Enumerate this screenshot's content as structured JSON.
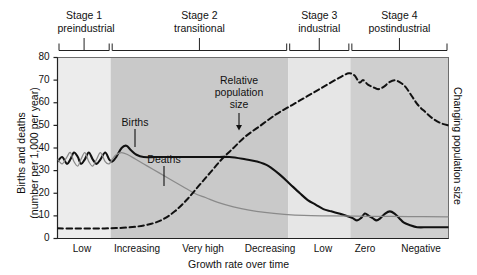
{
  "chart_data": {
    "type": "line",
    "ylabel_left_line1": "Births and deaths",
    "ylabel_left_line2": "(number per 1,000 per year)",
    "ylabel_right": "Changing population size",
    "xlabel": "Growth rate over time",
    "ylim": [
      0,
      80
    ],
    "yticks": [
      0,
      10,
      20,
      30,
      40,
      50,
      60,
      70,
      80
    ],
    "grid": false,
    "legend_position": "inline-annotations",
    "x_categories": [
      "Low",
      "Increasing",
      "Very high",
      "Decreasing",
      "Low",
      "Zero",
      "Negative"
    ],
    "stages": [
      {
        "label_line1": "Stage 1",
        "label_line2": "preindustrial",
        "start_pct": 0.0,
        "end_pct": 13.6,
        "shade": "#ececec"
      },
      {
        "label_line1": "Stage 2",
        "label_line2": "transitional",
        "start_pct": 13.6,
        "end_pct": 59.0,
        "shade": "#c9c9c9"
      },
      {
        "label_line1": "Stage 3",
        "label_line2": "industrial",
        "start_pct": 59.0,
        "end_pct": 74.9,
        "shade": "#e6e6e6"
      },
      {
        "label_line1": "Stage 4",
        "label_line2": "postindustrial",
        "start_pct": 74.9,
        "end_pct": 100.0,
        "shade": "#cfcfcf"
      }
    ],
    "annotations": [
      {
        "name": "births-label",
        "text": "Births"
      },
      {
        "name": "deaths-label",
        "text": "Deaths"
      },
      {
        "name": "relative-population-size-label",
        "text_line1": "Relative",
        "text_line2": "population",
        "text_line3": "size"
      }
    ],
    "series": [
      {
        "name": "Births",
        "style": "solid-thick-black",
        "color": "#111111",
        "points": [
          [
            0.0,
            34
          ],
          [
            1.2,
            36
          ],
          [
            2.4,
            33
          ],
          [
            3.3,
            35
          ],
          [
            4.2,
            38
          ],
          [
            5.2,
            36
          ],
          [
            6.0,
            33
          ],
          [
            7.0,
            35
          ],
          [
            8.0,
            38
          ],
          [
            9.0,
            35
          ],
          [
            10.0,
            33
          ],
          [
            11.0,
            35
          ],
          [
            12.2,
            38
          ],
          [
            13.2,
            35
          ],
          [
            14.0,
            34
          ],
          [
            15.0,
            36
          ],
          [
            16.4,
            40
          ],
          [
            17.6,
            41
          ],
          [
            18.8,
            39
          ],
          [
            20.2,
            37
          ],
          [
            22.0,
            36
          ],
          [
            25.0,
            36
          ],
          [
            28.0,
            36
          ],
          [
            32.0,
            36
          ],
          [
            36.0,
            36
          ],
          [
            40.0,
            36
          ],
          [
            44.0,
            36
          ],
          [
            48.0,
            35
          ],
          [
            51.0,
            34
          ],
          [
            54.0,
            32
          ],
          [
            57.0,
            28
          ],
          [
            59.5,
            24
          ],
          [
            62.0,
            20
          ],
          [
            64.0,
            17
          ],
          [
            66.0,
            15
          ],
          [
            68.0,
            13
          ],
          [
            70.0,
            12
          ],
          [
            72.0,
            11
          ],
          [
            74.0,
            10
          ],
          [
            75.5,
            9
          ],
          [
            76.6,
            8
          ],
          [
            77.6,
            9
          ],
          [
            78.6,
            11
          ],
          [
            79.6,
            10
          ],
          [
            80.6,
            9
          ],
          [
            81.6,
            8
          ],
          [
            82.6,
            9
          ],
          [
            83.8,
            11
          ],
          [
            85.0,
            12
          ],
          [
            86.2,
            11
          ],
          [
            87.4,
            9
          ],
          [
            88.6,
            7
          ],
          [
            90.0,
            6
          ],
          [
            92.0,
            5
          ],
          [
            95.0,
            5
          ],
          [
            100.0,
            5
          ]
        ]
      },
      {
        "name": "Deaths",
        "style": "solid-thin-gray",
        "color": "#8a8a8a",
        "points": [
          [
            0.0,
            35
          ],
          [
            1.2,
            33
          ],
          [
            2.4,
            36
          ],
          [
            3.3,
            38
          ],
          [
            4.2,
            34
          ],
          [
            5.2,
            32
          ],
          [
            6.0,
            35
          ],
          [
            7.0,
            38
          ],
          [
            8.0,
            34
          ],
          [
            9.0,
            32
          ],
          [
            10.0,
            35
          ],
          [
            11.0,
            38
          ],
          [
            12.2,
            34
          ],
          [
            13.2,
            33
          ],
          [
            14.0,
            35
          ],
          [
            15.0,
            37
          ],
          [
            16.4,
            38
          ],
          [
            18.0,
            37
          ],
          [
            20.0,
            35
          ],
          [
            23.0,
            32
          ],
          [
            26.0,
            29
          ],
          [
            29.0,
            26
          ],
          [
            32.0,
            23
          ],
          [
            35.0,
            20
          ],
          [
            38.0,
            18
          ],
          [
            41.0,
            16
          ],
          [
            45.0,
            14
          ],
          [
            49.0,
            12.5
          ],
          [
            53.0,
            11.5
          ],
          [
            58.0,
            10.7
          ],
          [
            63.0,
            10.2
          ],
          [
            70.0,
            10.0
          ],
          [
            80.0,
            9.8
          ],
          [
            90.0,
            9.7
          ],
          [
            100.0,
            9.6
          ]
        ]
      },
      {
        "name": "Relative population size",
        "style": "dashed-black",
        "color": "#111111",
        "points": [
          [
            0.0,
            4.5
          ],
          [
            5.0,
            4.4
          ],
          [
            10.0,
            4.4
          ],
          [
            15.0,
            4.6
          ],
          [
            20.0,
            5.2
          ],
          [
            24.0,
            6.5
          ],
          [
            27.0,
            8.5
          ],
          [
            30.0,
            12
          ],
          [
            33.0,
            17
          ],
          [
            36.0,
            23
          ],
          [
            39.0,
            29
          ],
          [
            42.0,
            35
          ],
          [
            45.0,
            40
          ],
          [
            48.0,
            45
          ],
          [
            52.0,
            50
          ],
          [
            56.0,
            55
          ],
          [
            60.0,
            59
          ],
          [
            64.0,
            63
          ],
          [
            68.0,
            67
          ],
          [
            72.0,
            71
          ],
          [
            74.5,
            73
          ],
          [
            76.0,
            72
          ],
          [
            77.2,
            69
          ],
          [
            78.2,
            70
          ],
          [
            79.4,
            68
          ],
          [
            80.6,
            67
          ],
          [
            82.0,
            66
          ],
          [
            83.4,
            67
          ],
          [
            84.8,
            69
          ],
          [
            86.2,
            70
          ],
          [
            87.6,
            69
          ],
          [
            89.0,
            67
          ],
          [
            90.6,
            63
          ],
          [
            92.2,
            59
          ],
          [
            94.0,
            56
          ],
          [
            96.0,
            53
          ],
          [
            98.0,
            51
          ],
          [
            100.0,
            50
          ]
        ]
      }
    ]
  }
}
